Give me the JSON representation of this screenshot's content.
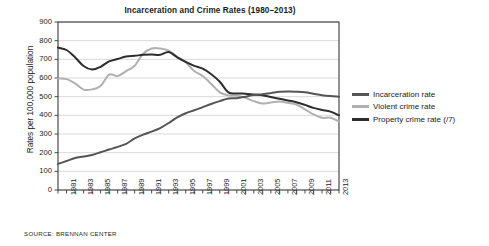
{
  "figure": {
    "title": "Incarceration and Crime Rates (1980–2013)",
    "source": "SOURCE: BRENNAN CENTER",
    "ylabel": "Rates per 100,000 population"
  },
  "legend": {
    "position": "right",
    "items": [
      {
        "label": "Incarceration rate",
        "color": "#555555"
      },
      {
        "label": "Violent crime rate",
        "color": "#b0b0b0"
      },
      {
        "label": "Property crime rate (/7)",
        "color": "#2d2d2d"
      }
    ]
  },
  "chart_data": {
    "type": "line",
    "title": "Incarceration and Crime Rates (1980–2013)",
    "xlabel": "",
    "ylabel": "Rates per 100,000 population",
    "source": "SOURCE: BRENNAN CENTER",
    "xlim": [
      1980,
      2013
    ],
    "ylim": [
      0,
      900
    ],
    "yticks": [
      0,
      100,
      200,
      300,
      400,
      500,
      600,
      700,
      800,
      900
    ],
    "ytick_labels": [
      "0",
      "100",
      "200",
      "300",
      "400",
      "500",
      "600",
      "700",
      "800",
      "900"
    ],
    "grid": "horizontal",
    "legend_position": "right",
    "x": [
      1980,
      1981,
      1982,
      1983,
      1984,
      1985,
      1986,
      1987,
      1988,
      1989,
      1990,
      1991,
      1992,
      1993,
      1994,
      1995,
      1996,
      1997,
      1998,
      1999,
      2000,
      2001,
      2002,
      2003,
      2004,
      2005,
      2006,
      2007,
      2008,
      2009,
      2010,
      2011,
      2012,
      2013
    ],
    "xtick_labels": [
      "1981",
      "1983",
      "1985",
      "1987",
      "1989",
      "1991",
      "1993",
      "1995",
      "1997",
      "1999",
      "2001",
      "2003",
      "2005",
      "2007",
      "2009",
      "2011",
      "2013"
    ],
    "series": [
      {
        "name": "Incarceration rate",
        "color": "#555555",
        "values": [
          140,
          155,
          171,
          179,
          188,
          202,
          217,
          231,
          247,
          276,
          297,
          313,
          332,
          359,
          389,
          411,
          427,
          444,
          461,
          476,
          490,
          492,
          500,
          509,
          513,
          519,
          526,
          528,
          527,
          524,
          516,
          508,
          503,
          500
        ]
      },
      {
        "name": "Violent crime rate",
        "color": "#b0b0b0",
        "values": [
          597,
          594,
          571,
          538,
          539,
          557,
          618,
          610,
          637,
          666,
          730,
          758,
          758,
          747,
          714,
          685,
          637,
          611,
          568,
          523,
          507,
          505,
          494,
          476,
          463,
          469,
          474,
          467,
          458,
          432,
          405,
          387,
          387,
          368
        ]
      },
      {
        "name": "Property crime rate (/7)",
        "color": "#2d2d2d",
        "values": [
          763,
          750,
          711,
          664,
          645,
          660,
          689,
          702,
          715,
          719,
          724,
          726,
          724,
          739,
          711,
          686,
          665,
          650,
          620,
          580,
          523,
          517,
          516,
          512,
          508,
          498,
          489,
          480,
          470,
          456,
          440,
          429,
          420,
          400
        ]
      }
    ]
  }
}
